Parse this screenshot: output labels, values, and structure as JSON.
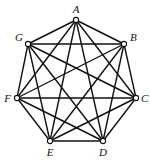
{
  "diagram": {
    "type": "complete-graph",
    "name": "K7",
    "vertices": [
      {
        "id": "A",
        "label": "A",
        "x": 76,
        "y": 20,
        "lx": 76,
        "ly": 13,
        "anchor": "middle"
      },
      {
        "id": "B",
        "label": "B",
        "x": 124,
        "y": 44,
        "lx": 130,
        "ly": 41,
        "anchor": "start"
      },
      {
        "id": "C",
        "label": "C",
        "x": 136,
        "y": 98,
        "lx": 141,
        "ly": 102,
        "anchor": "start"
      },
      {
        "id": "D",
        "label": "D",
        "x": 103,
        "y": 141,
        "lx": 103,
        "ly": 156,
        "anchor": "middle"
      },
      {
        "id": "E",
        "label": "E",
        "x": 50,
        "y": 141,
        "lx": 50,
        "ly": 156,
        "anchor": "middle"
      },
      {
        "id": "F",
        "label": "F",
        "x": 17,
        "y": 98,
        "lx": 11,
        "ly": 102,
        "anchor": "end"
      },
      {
        "id": "G",
        "label": "G",
        "x": 28,
        "y": 44,
        "lx": 23,
        "ly": 41,
        "anchor": "end"
      }
    ],
    "edges": [
      [
        "A",
        "B"
      ],
      [
        "A",
        "C"
      ],
      [
        "A",
        "D"
      ],
      [
        "A",
        "E"
      ],
      [
        "A",
        "F"
      ],
      [
        "A",
        "G"
      ],
      [
        "B",
        "C"
      ],
      [
        "B",
        "D"
      ],
      [
        "B",
        "E"
      ],
      [
        "B",
        "F"
      ],
      [
        "B",
        "G"
      ],
      [
        "C",
        "D"
      ],
      [
        "C",
        "E"
      ],
      [
        "C",
        "F"
      ],
      [
        "C",
        "G"
      ],
      [
        "D",
        "E"
      ],
      [
        "D",
        "F"
      ],
      [
        "D",
        "G"
      ],
      [
        "E",
        "F"
      ],
      [
        "E",
        "G"
      ],
      [
        "F",
        "G"
      ]
    ],
    "colors": {
      "stroke": "#111111",
      "vertex_fill": "#ffffff",
      "background": "#ffffff"
    }
  }
}
